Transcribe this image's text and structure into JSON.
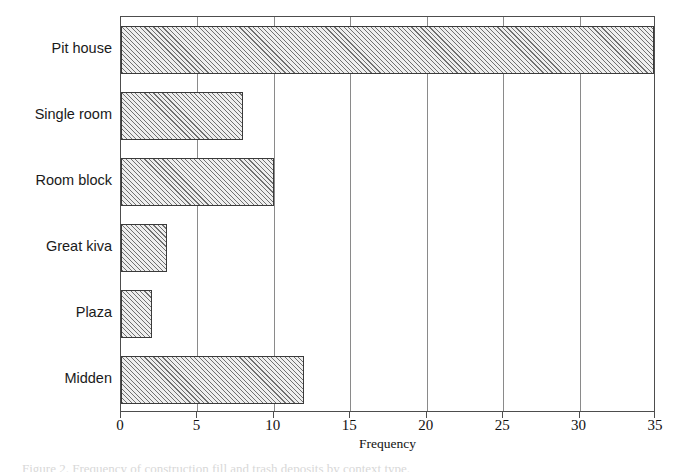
{
  "chart_data": {
    "type": "bar",
    "orientation": "horizontal",
    "title": "",
    "xlabel": "Frequency",
    "ylabel": "",
    "categories": [
      "Pit house",
      "Single room",
      "Room block",
      "Great kiva",
      "Plaza",
      "Midden"
    ],
    "values": [
      35,
      8,
      10,
      3,
      2,
      12
    ],
    "xlim": [
      0,
      35
    ],
    "xticks": [
      0,
      5,
      10,
      15,
      20,
      25,
      30,
      35
    ],
    "xticklabels": [
      "0",
      "5",
      "10",
      "15",
      "20",
      "25",
      "30",
      "35"
    ],
    "grid": "vertical",
    "legend": "none",
    "bar_fill": "#eeeeee",
    "bar_hatch": "diagonal",
    "bar_edge_color": "#3a3a3a",
    "gridline_color": "#8a8a8a",
    "axis_color": "#4d4d4d"
  },
  "caption": {
    "text": "Figure 2. Frequency of construction fill and trash deposits by context type."
  }
}
